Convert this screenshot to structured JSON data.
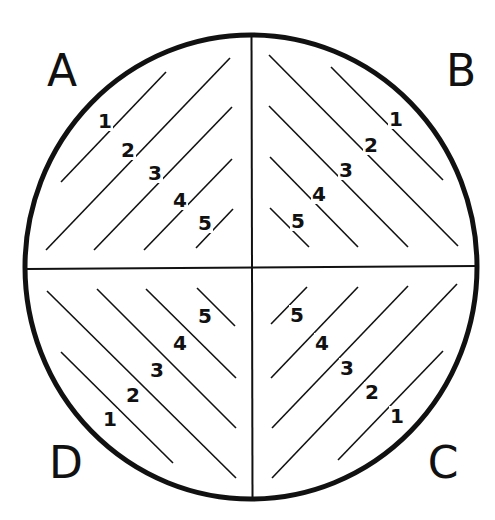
{
  "diagram": {
    "shape": "circle divided into four quadrants with diagonal hatch lines",
    "quadrants": [
      {
        "id": "A",
        "label": "A",
        "position": "top-left",
        "lines": [
          {
            "label": "1",
            "x1": 61,
            "y1": 182,
            "x2": 166,
            "y2": 72,
            "lx": 105,
            "ly": 128
          },
          {
            "label": "2",
            "x1": 46,
            "y1": 250,
            "x2": 230,
            "y2": 58,
            "lx": 128,
            "ly": 157
          },
          {
            "label": "3",
            "x1": 94,
            "y1": 250,
            "x2": 232,
            "y2": 107,
            "lx": 155,
            "ly": 180
          },
          {
            "label": "4",
            "x1": 144,
            "y1": 250,
            "x2": 232,
            "y2": 159,
            "lx": 180,
            "ly": 207
          },
          {
            "label": "5",
            "x1": 196,
            "y1": 248,
            "x2": 233,
            "y2": 209,
            "lx": 205,
            "ly": 230
          }
        ]
      },
      {
        "id": "B",
        "label": "B",
        "position": "top-right",
        "lines": [
          {
            "label": "1",
            "x1": 331,
            "y1": 67,
            "x2": 443,
            "y2": 180,
            "lx": 396,
            "ly": 126
          },
          {
            "label": "2",
            "x1": 269,
            "y1": 55,
            "x2": 458,
            "y2": 246,
            "lx": 371,
            "ly": 152
          },
          {
            "label": "3",
            "x1": 269,
            "y1": 106,
            "x2": 408,
            "y2": 247,
            "lx": 346,
            "ly": 177
          },
          {
            "label": "4",
            "x1": 270,
            "y1": 157,
            "x2": 358,
            "y2": 247,
            "lx": 319,
            "ly": 201
          },
          {
            "label": "5",
            "x1": 270,
            "y1": 208,
            "x2": 309,
            "y2": 247,
            "lx": 298,
            "ly": 228
          }
        ]
      },
      {
        "id": "C",
        "label": "C",
        "position": "bottom-right",
        "lines": [
          {
            "label": "1",
            "x1": 338,
            "y1": 460,
            "x2": 443,
            "y2": 351,
            "lx": 397,
            "ly": 423
          },
          {
            "label": "2",
            "x1": 272,
            "y1": 478,
            "x2": 457,
            "y2": 284,
            "lx": 372,
            "ly": 399
          },
          {
            "label": "3",
            "x1": 272,
            "y1": 428,
            "x2": 408,
            "y2": 286,
            "lx": 347,
            "ly": 375
          },
          {
            "label": "4",
            "x1": 271,
            "y1": 378,
            "x2": 358,
            "y2": 287,
            "lx": 322,
            "ly": 350
          },
          {
            "label": "5",
            "x1": 271,
            "y1": 324,
            "x2": 307,
            "y2": 287,
            "lx": 297,
            "ly": 322
          }
        ]
      },
      {
        "id": "D",
        "label": "D",
        "position": "bottom-left",
        "lines": [
          {
            "label": "1",
            "x1": 61,
            "y1": 352,
            "x2": 173,
            "y2": 463,
            "lx": 110,
            "ly": 426
          },
          {
            "label": "2",
            "x1": 47,
            "y1": 291,
            "x2": 236,
            "y2": 478,
            "lx": 133,
            "ly": 402
          },
          {
            "label": "3",
            "x1": 97,
            "y1": 289,
            "x2": 236,
            "y2": 428,
            "lx": 157,
            "ly": 377
          },
          {
            "label": "4",
            "x1": 146,
            "y1": 289,
            "x2": 236,
            "y2": 378,
            "lx": 180,
            "ly": 350
          },
          {
            "label": "5",
            "x1": 197,
            "y1": 288,
            "x2": 235,
            "y2": 326,
            "lx": 205,
            "ly": 323
          }
        ]
      }
    ],
    "letters": [
      {
        "text": "A",
        "x": 62,
        "y": 86
      },
      {
        "text": "B",
        "x": 461,
        "y": 86
      },
      {
        "text": "C",
        "x": 443,
        "y": 478
      },
      {
        "text": "D",
        "x": 66,
        "y": 478
      }
    ],
    "colors": {
      "ink": "#111111",
      "background": "#ffffff"
    }
  }
}
